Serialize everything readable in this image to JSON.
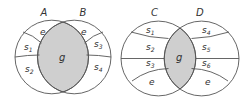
{
  "colors": {
    "intersection_fill": "#cfcfcf",
    "stroke": "#555555",
    "text": "#333333",
    "background": "#ffffff"
  },
  "left_diagram": {
    "sets": [
      {
        "name": "A",
        "label": "A"
      },
      {
        "name": "B",
        "label": "B"
      }
    ],
    "regions": {
      "a_top": {
        "letter": "e",
        "sub": ""
      },
      "a_mid": {
        "letter": "s",
        "sub": "1"
      },
      "a_bot": {
        "letter": "s",
        "sub": "2"
      },
      "intersection": {
        "letter": "g",
        "sub": ""
      },
      "b_top": {
        "letter": "e",
        "sub": ""
      },
      "b_mid": {
        "letter": "s",
        "sub": "3"
      },
      "b_bot": {
        "letter": "s",
        "sub": "4"
      }
    }
  },
  "right_diagram": {
    "sets": [
      {
        "name": "C",
        "label": "C"
      },
      {
        "name": "D",
        "label": "D"
      }
    ],
    "regions": {
      "c_1": {
        "letter": "s",
        "sub": "1"
      },
      "c_2": {
        "letter": "s",
        "sub": "2"
      },
      "c_3": {
        "letter": "s",
        "sub": "3"
      },
      "c_4": {
        "letter": "e",
        "sub": ""
      },
      "intersection": {
        "letter": "g",
        "sub": ""
      },
      "d_1": {
        "letter": "s",
        "sub": "4"
      },
      "d_2": {
        "letter": "s",
        "sub": "5"
      },
      "d_3": {
        "letter": "s",
        "sub": "6"
      },
      "d_4": {
        "letter": "e",
        "sub": ""
      }
    }
  }
}
